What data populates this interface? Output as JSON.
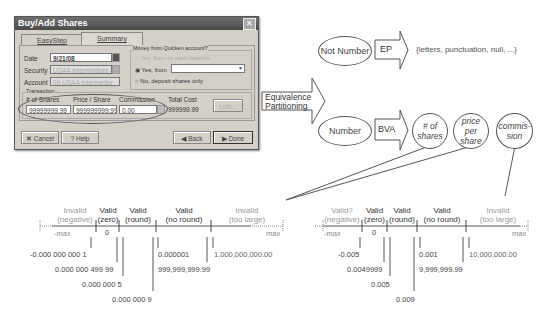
{
  "dialog": {
    "title": "Buy/Add Shares",
    "tabs": [
      {
        "label": "EasyStep"
      },
      {
        "label": "Summary"
      }
    ],
    "fields": {
      "date_label": "Date",
      "date_value": "9/21/08",
      "security_label": "Security",
      "security_value": "USAA Intermediate-T",
      "account_label": "Account",
      "account_value": "IIII USAA Intermedia"
    },
    "money_group": {
      "title": "Money from Quicken account?",
      "option_1": "Yes, from its cash balance",
      "option_2": "Yes, from",
      "option_3": "No, deposit shares only"
    },
    "transaction": {
      "title": "Transaction",
      "shares_label": "# of Shares",
      "shares_value": "99999999.99",
      "price_label": "Price / Share",
      "price_value": "999999999.99",
      "commission_label": "Commission",
      "commission_value": "0.00",
      "total_label": "Total Cost",
      "total_value": "999999.99",
      "lots_button": "Lots..."
    },
    "buttons": {
      "cancel": "Cancel",
      "help": "Help",
      "back": "Back",
      "done": "Done"
    }
  },
  "diagram": {
    "ep_arrow": "Equivalence Partitioning",
    "not_number": "Not Number",
    "ep": "EP",
    "ep_set": "{letters, punctuation, null, ...}",
    "number": "Number",
    "bva": "BVA",
    "shares": "# of shares",
    "price": "price per share",
    "commission": "commis- sion"
  },
  "number_lines": [
    {
      "segments": [
        {
          "l1": "Invalid",
          "l2": "(negative)",
          "valid": false
        },
        {
          "l1": "Valid",
          "l2": "(zero)",
          "valid": true
        },
        {
          "l1": "Valid",
          "l2": "(round)",
          "valid": true
        },
        {
          "l1": "Valid",
          "l2": "(no round)",
          "valid": true
        },
        {
          "l1": "Invalid",
          "l2": "(too large)",
          "valid": false
        }
      ],
      "min": "-max",
      "zero": "0",
      "max": "max",
      "values": [
        "-0.000 000 000 1",
        "0.000 000 499 99",
        "0.000 000 5",
        "0.000 000 9",
        "0.000001",
        "999,999,999.99",
        "1,000,000,000.00"
      ]
    },
    {
      "segments": [
        {
          "l1": "Valid?",
          "l2": "(negative)",
          "valid": false
        },
        {
          "l1": "Valid",
          "l2": "(zero)",
          "valid": true
        },
        {
          "l1": "Valid",
          "l2": "(round)",
          "valid": true
        },
        {
          "l1": "Valid",
          "l2": "(no round)",
          "valid": true
        },
        {
          "l1": "Invalid",
          "l2": "(too large)",
          "valid": false
        }
      ],
      "min": "-max",
      "zero": "0",
      "max": "max",
      "values": [
        "-0.005",
        "0.0049999",
        "0.005",
        "0.009",
        "0.001",
        "9,999,999.99",
        "10,000,000.00"
      ]
    }
  ]
}
